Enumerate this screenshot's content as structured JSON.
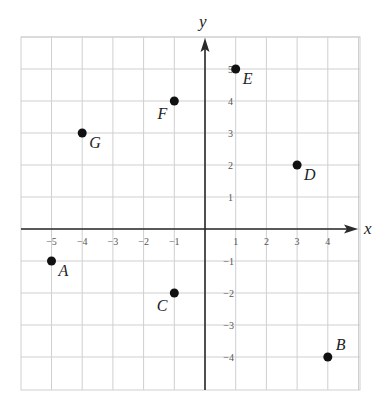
{
  "chart_data": {
    "type": "scatter",
    "title": "",
    "xlabel": "x",
    "ylabel": "y",
    "xlim": [
      -6,
      5
    ],
    "ylim": [
      -5,
      6
    ],
    "grid": true,
    "x_ticks": [
      -5,
      -4,
      -3,
      -2,
      -1,
      1,
      2,
      3,
      4
    ],
    "y_ticks": [
      5,
      4,
      3,
      2,
      1,
      -1,
      -2,
      -3,
      -4
    ],
    "x_tick_labels": [
      "−5",
      "−4",
      "−3",
      "−2",
      "−1",
      "1",
      "2",
      "3",
      "4"
    ],
    "y_tick_labels": [
      "5",
      "4",
      "3",
      "2",
      "1",
      "−1",
      "−2",
      "−3",
      "−4"
    ],
    "points": [
      {
        "label": "A",
        "x": -5,
        "y": -1,
        "label_pos": "below-right"
      },
      {
        "label": "B",
        "x": 4,
        "y": -4,
        "label_pos": "above-right"
      },
      {
        "label": "C",
        "x": -1,
        "y": -2,
        "label_pos": "below-left"
      },
      {
        "label": "D",
        "x": 3,
        "y": 2,
        "label_pos": "below-right"
      },
      {
        "label": "E",
        "x": 1,
        "y": 5,
        "label_pos": "below-right"
      },
      {
        "label": "F",
        "x": -1,
        "y": 4,
        "label_pos": "below-left"
      },
      {
        "label": "G",
        "x": -4,
        "y": 3,
        "label_pos": "below-right"
      }
    ]
  },
  "colors": {
    "grid": "#cfcfcf",
    "axis": "#2a2a2a",
    "point": "#111111",
    "tick_text": "#555555"
  }
}
